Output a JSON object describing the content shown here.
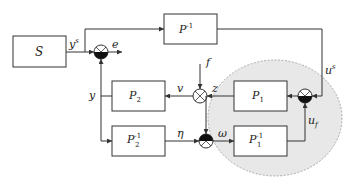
{
  "diagram": {
    "type": "block-diagram",
    "blocks": {
      "S": {
        "label": "S"
      },
      "P_inv": {
        "label": "P",
        "sup": "-1"
      },
      "P2": {
        "label": "P",
        "sub": "2"
      },
      "P2_inv": {
        "label": "P",
        "sub": "2",
        "sup": "-1"
      },
      "P1": {
        "label": "P",
        "sub": "1"
      },
      "P1_inv": {
        "label": "P",
        "sub": "1",
        "sup": "-1"
      }
    },
    "signals": {
      "ys": {
        "label": "y",
        "sup": "s"
      },
      "e": {
        "label": "e"
      },
      "y": {
        "label": "y"
      },
      "f": {
        "label": "f"
      },
      "v": {
        "label": "v"
      },
      "z": {
        "label": "z"
      },
      "eta": {
        "label": "η"
      },
      "omega": {
        "label": "ω"
      },
      "us": {
        "label": "u",
        "sup": "s"
      },
      "uf": {
        "label": "u",
        "sub": "f"
      }
    },
    "colors": {
      "stroke": "#333333",
      "ellipse_fill": "#e8e8e8",
      "ellipse_stroke": "#999999",
      "background": "#ffffff"
    }
  }
}
